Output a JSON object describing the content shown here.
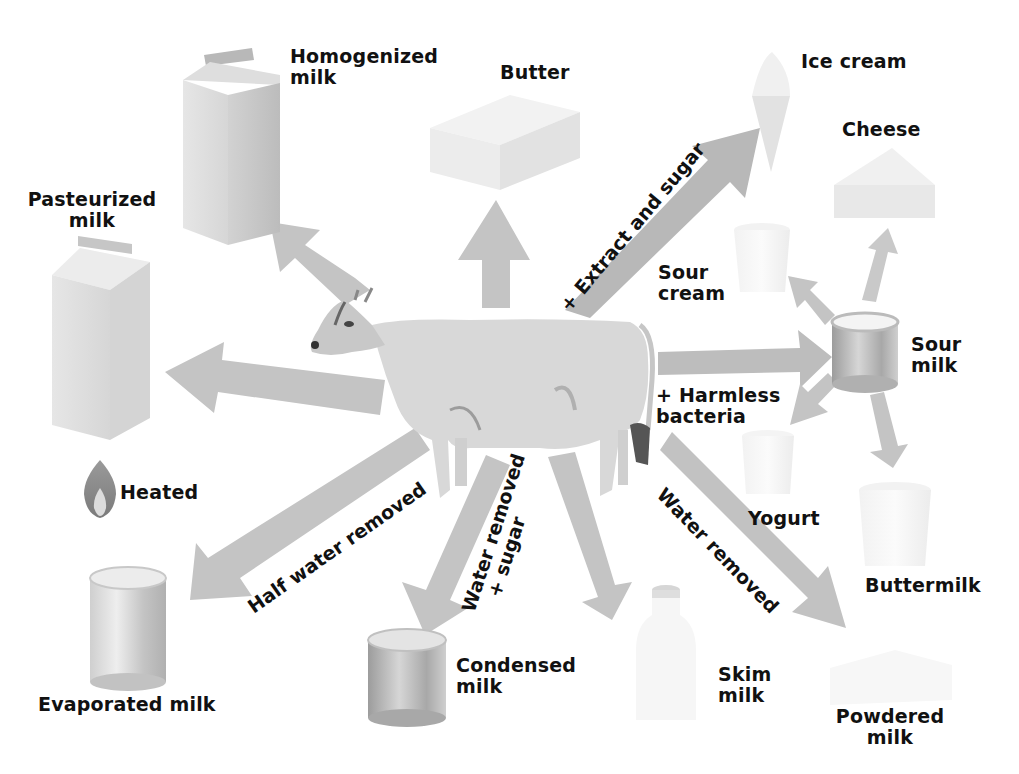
{
  "diagram": {
    "title": "",
    "center": {
      "name": "Cow"
    },
    "colors": {
      "arrow": "#bdbdbd",
      "arrow_dark": "#a9a9a9",
      "product": "#e6e6e6",
      "text": "#111111",
      "flame_outer": "#8a8a8a",
      "flame_inner": "#d8d8d8"
    },
    "products": {
      "homogenized": {
        "line1": "Homogenized",
        "line2": "milk"
      },
      "butter": {
        "line1": "Butter"
      },
      "ice_cream": {
        "line1": "Ice cream"
      },
      "cheese": {
        "line1": "Cheese"
      },
      "pasteurized": {
        "line1": "Pasteurized",
        "line2": "milk"
      },
      "sour_cream": {
        "line1": "Sour",
        "line2": "cream"
      },
      "sour_milk": {
        "line1": "Sour",
        "line2": "milk"
      },
      "yogurt": {
        "line1": "Yogurt"
      },
      "buttermilk": {
        "line1": "Buttermilk"
      },
      "evaporated": {
        "line1": "Evaporated milk"
      },
      "condensed": {
        "line1": "Condensed",
        "line2": "milk"
      },
      "skim": {
        "line1": "Skim",
        "line2": "milk"
      },
      "powdered": {
        "line1": "Powdered",
        "line2": "milk"
      }
    },
    "processes": {
      "heated": "Heated",
      "extract_sugar": "+ Extract and sugar",
      "harmless_bacteria_1": "+ Harmless",
      "harmless_bacteria_2": "bacteria",
      "half_water": "Half water removed",
      "water_sugar_1": "Water removed",
      "water_sugar_2": "+ sugar",
      "water_removed": "Water removed"
    },
    "icons": {
      "flame": "flame-icon",
      "cow": "cow-illustration",
      "carton": "milk-carton-icon",
      "can": "milk-can-icon",
      "cup": "cup-icon",
      "bottle": "bottle-icon",
      "cone": "ice-cream-cone-icon",
      "wedge": "cheese-wedge-icon",
      "block": "butter-block-icon"
    }
  }
}
